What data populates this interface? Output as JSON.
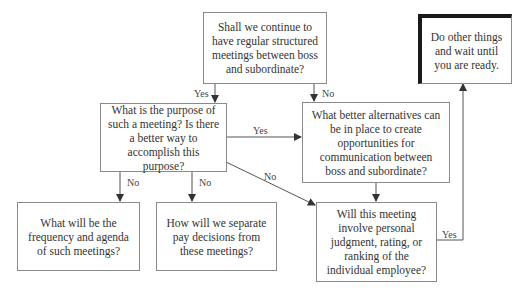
{
  "diagram": {
    "type": "flowchart",
    "nodes": {
      "start": {
        "text": "Shall we continue to have regular structured meetings between boss and subordinate?"
      },
      "purpose": {
        "text": "What is the purpose of such a meeting? Is there a better way to accomplish this purpose?"
      },
      "alternatives": {
        "text": "What better alternatives can be in place to create opportunities for communication between boss and subordinate?"
      },
      "wait": {
        "text": "Do other things and wait until you are ready."
      },
      "frequency": {
        "text": "What will be the frequency and agenda of such meetings?"
      },
      "separate_pay": {
        "text": "How will we separate pay decisions from these meetings?"
      },
      "judgment": {
        "text": "Will this meeting involve personal judgment, rating, or ranking of the individual employee?"
      }
    },
    "edges": [
      {
        "from": "start",
        "to": "purpose",
        "label": "Yes"
      },
      {
        "from": "start",
        "to": "alternatives",
        "label": "No"
      },
      {
        "from": "purpose",
        "to": "alternatives",
        "label": "Yes"
      },
      {
        "from": "purpose",
        "to": "frequency",
        "label": "No"
      },
      {
        "from": "purpose",
        "to": "separate_pay",
        "label": "No"
      },
      {
        "from": "purpose",
        "to": "judgment",
        "label": "No"
      },
      {
        "from": "alternatives",
        "to": "judgment",
        "label": ""
      },
      {
        "from": "judgment",
        "to": "wait",
        "label": "Yes"
      }
    ],
    "labels": {
      "start_yes": "Yes",
      "start_no": "No",
      "purpose_yes": "Yes",
      "purpose_no_1": "No",
      "purpose_no_2": "No",
      "purpose_no_3": "No",
      "judgment_yes": "Yes"
    },
    "colors": {
      "line": "#555555",
      "box_border": "#8a8a8a",
      "emphasis_border": "#1a1a1a",
      "text": "#333333"
    }
  }
}
